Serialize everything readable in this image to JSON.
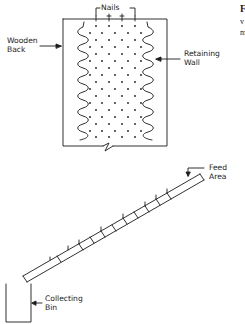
{
  "figure": {
    "type": "apparatus-diagram",
    "board": {
      "labels": {
        "nails": "Nails",
        "wooden_back": "Wooden\nBack",
        "retaining_wall": "Retaining\nWall"
      }
    },
    "ramp": {
      "labels": {
        "feed_area": "Feed\nArea"
      }
    },
    "bin": {
      "labels": {
        "collecting_bin": "Collecting\nBin"
      }
    },
    "caption_fragments": {
      "line1": "F",
      "line2": "v",
      "line3": "m"
    }
  },
  "colors": {
    "ink": "#1a1a1a",
    "background": "#ffffff"
  }
}
